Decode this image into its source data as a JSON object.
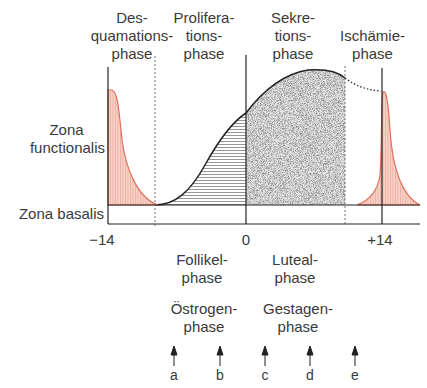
{
  "phases_top": [
    {
      "id": "desquamation",
      "lines": [
        "Des-",
        "quamations-",
        "phase"
      ]
    },
    {
      "id": "proliferation",
      "lines": [
        "Prolifera-",
        "tions-",
        "phase"
      ]
    },
    {
      "id": "secretion",
      "lines": [
        "Sekre-",
        "tions-",
        "phase"
      ]
    },
    {
      "id": "ischemia",
      "lines": [
        "Ischämie-",
        "phase"
      ]
    }
  ],
  "zones": {
    "functionalis": [
      "Zona",
      "functionalis"
    ],
    "basalis": "Zona basalis"
  },
  "axis": {
    "ticks": [
      {
        "label": "−14",
        "day": -14
      },
      {
        "label": "0",
        "day": 0
      },
      {
        "label": "+14",
        "day": 14
      }
    ]
  },
  "phases_bottom": {
    "ovarian": [
      {
        "id": "follicular",
        "lines": [
          "Follikel-",
          "phase"
        ]
      },
      {
        "id": "luteal",
        "lines": [
          "Luteal-",
          "phase"
        ]
      }
    ],
    "hormonal": [
      {
        "id": "estrogen",
        "lines": [
          "Östrogen-",
          "phase"
        ]
      },
      {
        "id": "gestagen",
        "lines": [
          "Gestagen-",
          "phase"
        ]
      }
    ]
  },
  "markers": [
    "a",
    "b",
    "c",
    "d",
    "e"
  ],
  "colors": {
    "menstruation": "#e0705a",
    "menstruation_fill": "#f6c9bf",
    "line": "#222222",
    "stipple": "#bdbdbd",
    "hatch": "#555555"
  }
}
